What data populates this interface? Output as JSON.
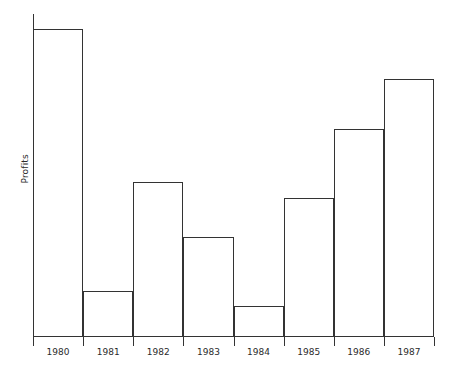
{
  "chart_data": {
    "type": "bar",
    "title": "",
    "subtitle": "",
    "xlabel": "",
    "ylabel": "Profits",
    "categories": [
      "1980",
      "1981",
      "1982",
      "1983",
      "1984",
      "1985",
      "1986",
      "1987"
    ],
    "values": [
      307,
      45,
      154,
      99,
      30,
      138,
      207,
      257
    ],
    "values_normalized": [
      1.0,
      0.147,
      0.502,
      0.323,
      0.098,
      0.45,
      0.674,
      0.837
    ],
    "ylim": [
      0,
      323
    ],
    "grid": false,
    "legend": null,
    "legend_position": "none",
    "y_tick_labels": [],
    "x_tick_labels": [
      "1980",
      "1981",
      "1982",
      "1983",
      "1984",
      "1985",
      "1986",
      "1987"
    ],
    "annotations": [],
    "series": [
      {
        "name": "Profits",
        "values": [
          307,
          45,
          154,
          99,
          30,
          138,
          207,
          257
        ]
      }
    ],
    "style": {
      "bar_fill": "#ffffff",
      "bar_stroke": "#333333",
      "axis_color": "#333333",
      "text_color": "#2b2b2b",
      "background": "#ffffff"
    }
  },
  "axes": {
    "y_label_text": "Profits"
  }
}
